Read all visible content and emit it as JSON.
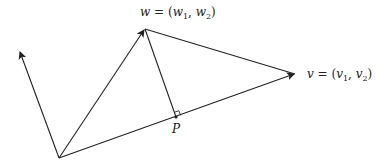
{
  "diagram": {
    "points": {
      "O": {
        "x": 59,
        "y": 158
      },
      "perp_tip": {
        "x": 20,
        "y": 51
      },
      "w": {
        "x": 145,
        "y": 29
      },
      "v": {
        "x": 295,
        "y": 74
      },
      "P": {
        "x": 176,
        "y": 117
      }
    },
    "labels": {
      "w_name": "w",
      "w_eq": " = (",
      "w_c1": "w",
      "w_c1_sub": "1",
      "w_sep": ", ",
      "w_c2": "w",
      "w_c2_sub": "2",
      "w_close": ")",
      "v_name": "v",
      "v_eq": " = (",
      "v_c1": "v",
      "v_c1_sub": "1",
      "v_sep": ", ",
      "v_c2": "v",
      "v_c2_sub": "2",
      "v_close": ")",
      "P": "P"
    },
    "colors": {
      "stroke": "#222222",
      "background": "#ffffff"
    }
  }
}
